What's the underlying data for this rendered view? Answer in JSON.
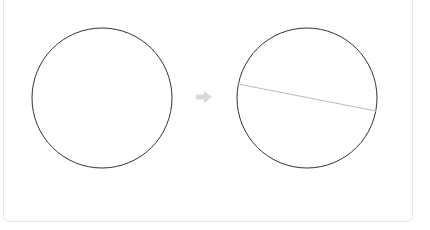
{
  "diagram": {
    "type": "geometry-transformation",
    "panels": [
      {
        "id": "before",
        "shape": "circle",
        "center": [
          102,
          98
        ],
        "radius": 70,
        "stroke": "#333333"
      },
      {
        "id": "after",
        "shape": "circle",
        "center": [
          307,
          98
        ],
        "radius": 70,
        "stroke": "#333333",
        "chord": {
          "from": [
            238,
            84
          ],
          "to": [
            376,
            111
          ],
          "stroke": "#bbbbbb"
        }
      }
    ],
    "arrow": {
      "icon": "right-arrow-icon",
      "color": "#d9d9d9",
      "center": [
        204,
        97
      ]
    }
  }
}
